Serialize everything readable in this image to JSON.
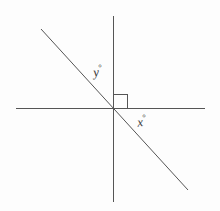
{
  "figure": {
    "type": "geometry-diagram",
    "background_color": "#fdfdfd",
    "line_color": "#555555",
    "label_color": "#3a3a3a",
    "canvas": {
      "width": 220,
      "height": 211
    },
    "origin": {
      "x": 113,
      "y": 108
    },
    "lines": [
      {
        "name": "horizontal-axis",
        "x1": 16,
        "y1": 108,
        "x2": 205,
        "y2": 108,
        "stroke_width": 1
      },
      {
        "name": "vertical-axis",
        "x1": 113,
        "y1": 16,
        "x2": 113,
        "y2": 202,
        "stroke_width": 1
      },
      {
        "name": "diagonal-transversal",
        "x1": 41,
        "y1": 29,
        "x2": 188,
        "y2": 190,
        "stroke_width": 1
      }
    ],
    "right_angle_marker": {
      "name": "right-angle-square",
      "corner_x": 113,
      "corner_y": 108,
      "size": 14,
      "quadrant": "upper-right"
    },
    "labels": {
      "y_angle": {
        "text": "y",
        "degree_symbol": "°",
        "x": 93,
        "y": 64,
        "region": "upper-left-between-diagonal-and-vertical"
      },
      "x_angle": {
        "text": "x",
        "degree_symbol": "°",
        "x": 137,
        "y": 114,
        "region": "lower-right-between-horizontal-and-diagonal"
      }
    }
  }
}
